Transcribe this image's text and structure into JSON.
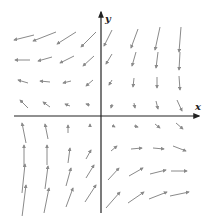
{
  "figure": {
    "type": "vector-field",
    "x_label": "x",
    "y_label": "y",
    "axis_color": "#222222",
    "arrow_color": "#8a8a8a"
  },
  "axes": {
    "origin": [
      101,
      116
    ],
    "x_axis": {
      "from": [
        14,
        116
      ],
      "to": [
        199,
        116
      ]
    },
    "y_axis": {
      "from": [
        101,
        213
      ],
      "to": [
        101,
        12
      ]
    },
    "x_label_pos": [
      195,
      110
    ],
    "y_label_pos": [
      105,
      22
    ]
  },
  "vectors": [
    {
      "x1": 34,
      "y1": 35,
      "x2": 14,
      "y2": 40
    },
    {
      "x1": 56,
      "y1": 32,
      "x2": 33,
      "y2": 41
    },
    {
      "x1": 76,
      "y1": 32,
      "x2": 57,
      "y2": 44
    },
    {
      "x1": 96,
      "y1": 32,
      "x2": 81,
      "y2": 47
    },
    {
      "x1": 30,
      "y1": 60,
      "x2": 15,
      "y2": 60
    },
    {
      "x1": 52,
      "y1": 57,
      "x2": 38,
      "y2": 61
    },
    {
      "x1": 74,
      "y1": 56,
      "x2": 60,
      "y2": 63
    },
    {
      "x1": 94,
      "y1": 56,
      "x2": 83,
      "y2": 66
    },
    {
      "x1": 28,
      "y1": 83,
      "x2": 18,
      "y2": 80
    },
    {
      "x1": 50,
      "y1": 82,
      "x2": 40,
      "y2": 81
    },
    {
      "x1": 71,
      "y1": 81,
      "x2": 63,
      "y2": 83
    },
    {
      "x1": 93,
      "y1": 80,
      "x2": 86,
      "y2": 86
    },
    {
      "x1": 28,
      "y1": 108,
      "x2": 20,
      "y2": 100
    },
    {
      "x1": 50,
      "y1": 107,
      "x2": 43,
      "y2": 102
    },
    {
      "x1": 70,
      "y1": 106,
      "x2": 65,
      "y2": 104
    },
    {
      "x1": 90,
      "y1": 105,
      "x2": 86,
      "y2": 104
    },
    {
      "x1": 112,
      "y1": 30,
      "x2": 104,
      "y2": 46
    },
    {
      "x1": 138,
      "y1": 29,
      "x2": 131,
      "y2": 48
    },
    {
      "x1": 160,
      "y1": 27,
      "x2": 155,
      "y2": 50
    },
    {
      "x1": 181,
      "y1": 27,
      "x2": 179,
      "y2": 52
    },
    {
      "x1": 112,
      "y1": 54,
      "x2": 106,
      "y2": 64
    },
    {
      "x1": 136,
      "y1": 52,
      "x2": 132,
      "y2": 66
    },
    {
      "x1": 158,
      "y1": 52,
      "x2": 156,
      "y2": 68
    },
    {
      "x1": 180,
      "y1": 52,
      "x2": 179,
      "y2": 70
    },
    {
      "x1": 112,
      "y1": 80,
      "x2": 109,
      "y2": 85
    },
    {
      "x1": 134,
      "y1": 78,
      "x2": 133,
      "y2": 87
    },
    {
      "x1": 157,
      "y1": 77,
      "x2": 157,
      "y2": 88
    },
    {
      "x1": 179,
      "y1": 76,
      "x2": 180,
      "y2": 90
    },
    {
      "x1": 112,
      "y1": 104,
      "x2": 111,
      "y2": 108
    },
    {
      "x1": 134,
      "y1": 103,
      "x2": 135,
      "y2": 108
    },
    {
      "x1": 156,
      "y1": 101,
      "x2": 158,
      "y2": 109
    },
    {
      "x1": 177,
      "y1": 100,
      "x2": 182,
      "y2": 111
    },
    {
      "x1": 26,
      "y1": 143,
      "x2": 22,
      "y2": 123
    },
    {
      "x1": 48,
      "y1": 139,
      "x2": 45,
      "y2": 124
    },
    {
      "x1": 68,
      "y1": 133,
      "x2": 68,
      "y2": 125
    },
    {
      "x1": 90,
      "y1": 127,
      "x2": 90,
      "y2": 124
    },
    {
      "x1": 24,
      "y1": 167,
      "x2": 24,
      "y2": 145
    },
    {
      "x1": 47,
      "y1": 165,
      "x2": 47,
      "y2": 145
    },
    {
      "x1": 68,
      "y1": 163,
      "x2": 70,
      "y2": 148
    },
    {
      "x1": 86,
      "y1": 159,
      "x2": 91,
      "y2": 150
    },
    {
      "x1": 22,
      "y1": 193,
      "x2": 25,
      "y2": 164
    },
    {
      "x1": 45,
      "y1": 189,
      "x2": 48,
      "y2": 166
    },
    {
      "x1": 66,
      "y1": 186,
      "x2": 71,
      "y2": 168
    },
    {
      "x1": 86,
      "y1": 178,
      "x2": 94,
      "y2": 165
    },
    {
      "x1": 22,
      "y1": 217,
      "x2": 26,
      "y2": 185
    },
    {
      "x1": 44,
      "y1": 213,
      "x2": 49,
      "y2": 188
    },
    {
      "x1": 66,
      "y1": 207,
      "x2": 73,
      "y2": 188
    },
    {
      "x1": 85,
      "y1": 202,
      "x2": 96,
      "y2": 185
    },
    {
      "x1": 113,
      "y1": 126,
      "x2": 115,
      "y2": 127
    },
    {
      "x1": 134,
      "y1": 126,
      "x2": 138,
      "y2": 127
    },
    {
      "x1": 155,
      "y1": 124,
      "x2": 160,
      "y2": 128
    },
    {
      "x1": 176,
      "y1": 123,
      "x2": 183,
      "y2": 129
    },
    {
      "x1": 111,
      "y1": 151,
      "x2": 117,
      "y2": 146
    },
    {
      "x1": 131,
      "y1": 149,
      "x2": 142,
      "y2": 148
    },
    {
      "x1": 153,
      "y1": 148,
      "x2": 164,
      "y2": 149
    },
    {
      "x1": 173,
      "y1": 146,
      "x2": 186,
      "y2": 151
    },
    {
      "x1": 108,
      "y1": 180,
      "x2": 119,
      "y2": 168
    },
    {
      "x1": 129,
      "y1": 176,
      "x2": 143,
      "y2": 168
    },
    {
      "x1": 150,
      "y1": 174,
      "x2": 166,
      "y2": 170
    },
    {
      "x1": 171,
      "y1": 171,
      "x2": 187,
      "y2": 171
    },
    {
      "x1": 106,
      "y1": 208,
      "x2": 120,
      "y2": 192
    },
    {
      "x1": 128,
      "y1": 203,
      "x2": 144,
      "y2": 192
    },
    {
      "x1": 149,
      "y1": 199,
      "x2": 167,
      "y2": 192
    },
    {
      "x1": 170,
      "y1": 196,
      "x2": 189,
      "y2": 192
    }
  ]
}
